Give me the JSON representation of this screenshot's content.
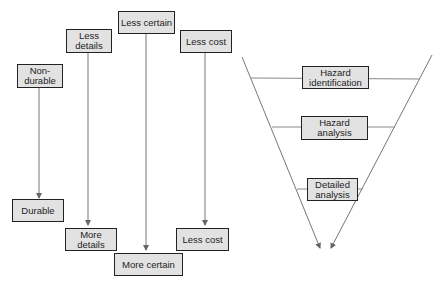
{
  "left_diagram": {
    "top_boxes": [
      {
        "label": "Non-\ndurable"
      },
      {
        "label": "Less details"
      },
      {
        "label": "Less certain"
      },
      {
        "label": "Less cost"
      }
    ],
    "bottom_boxes": [
      {
        "label": "Durable"
      },
      {
        "label": "More details"
      },
      {
        "label": "More certain"
      },
      {
        "label": "Less cost"
      }
    ]
  },
  "right_diagram": {
    "stages": [
      {
        "label": "Hazard identification"
      },
      {
        "label": "Hazard analysis"
      },
      {
        "label": "Detailed analysis"
      }
    ]
  },
  "colors": {
    "box_fill": "#e2e2e2",
    "box_border": "#222222",
    "line": "#777777"
  }
}
